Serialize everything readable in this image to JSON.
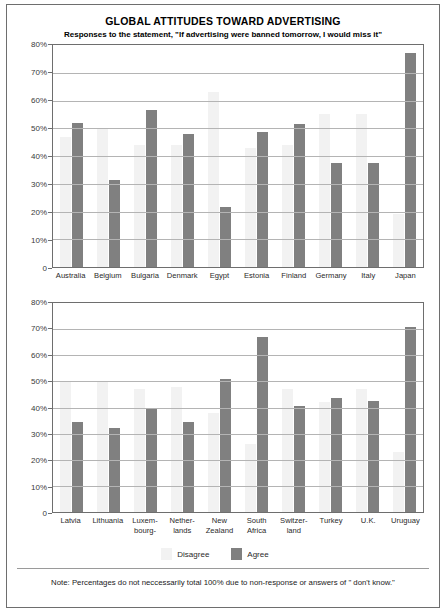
{
  "chart_data": [
    {
      "type": "bar",
      "title": "GLOBAL ATTITUDES TOWARD ADVERTISING",
      "subtitle": "Responses to the statement, \"If advertising were banned tomorrow, I would miss it\"",
      "panel": 1,
      "xlabel": "",
      "ylabel": "",
      "ylim": [
        0,
        80
      ],
      "yticks": [
        "0",
        "10%",
        "20%",
        "30%",
        "40%",
        "50%",
        "60%",
        "70%",
        "80%"
      ],
      "grid": true,
      "legend_position": "bottom",
      "categories": [
        "Australia",
        "Belgium",
        "Bulgaria",
        "Denmark",
        "Egypt",
        "Estonia",
        "Finland",
        "Germany",
        "Italy",
        "Japan"
      ],
      "series": [
        {
          "name": "Disagree",
          "color": "#f2f2f2",
          "values": [
            47,
            50,
            44,
            44,
            63,
            43,
            44,
            55,
            55,
            19
          ]
        },
        {
          "name": "Agree",
          "color": "#808080",
          "values": [
            52,
            31.5,
            56.5,
            48,
            21.5,
            48.5,
            51.5,
            37.5,
            37.5,
            77
          ]
        }
      ]
    },
    {
      "type": "bar",
      "panel": 2,
      "xlabel": "",
      "ylabel": "",
      "ylim": [
        0,
        80
      ],
      "yticks": [
        "0",
        "10%",
        "20%",
        "30%",
        "40%",
        "50%",
        "60%",
        "70%",
        "80%"
      ],
      "grid": true,
      "legend_position": "bottom",
      "categories": [
        "Latvia",
        "Lithuania",
        "Luxem-\nbourg-",
        "Nether-\nlands",
        "New\nZealand",
        "South\nAfrica",
        "Switzer-\nland",
        "Turkey",
        "U.K.",
        "Uruguay"
      ],
      "series": [
        {
          "name": "Disagree",
          "color": "#f2f2f2",
          "values": [
            50,
            50,
            47,
            48,
            38,
            26,
            47,
            42,
            47,
            23
          ]
        },
        {
          "name": "Agree",
          "color": "#808080",
          "values": [
            34.5,
            32,
            40,
            34.5,
            51,
            67,
            40.5,
            43.5,
            42.5,
            71
          ]
        }
      ]
    }
  ],
  "header": {
    "title": "GLOBAL ATTITUDES TOWARD ADVERTISING",
    "subtitle": "Responses to the statement, \"If advertising were banned tomorrow, I would miss it\""
  },
  "axis": {
    "ticks": [
      "80%",
      "70%",
      "60%",
      "50%",
      "40%",
      "30%",
      "20%",
      "10%",
      "0"
    ]
  },
  "panel1": {
    "categories": [
      "Australia",
      "Belgium",
      "Bulgaria",
      "Denmark",
      "Egypt",
      "Estonia",
      "Finland",
      "Germany",
      "Italy",
      "Japan"
    ]
  },
  "panel2": {
    "categories": [
      "Latvia",
      "Lithuania",
      "Luxem-\nbourg-",
      "Nether-\nlands",
      "New\nZealand",
      "South\nAfrica",
      "Switzer-\nland",
      "Turkey",
      "U.K.",
      "Uruguay"
    ]
  },
  "legend": {
    "items": [
      {
        "label": "Disagree",
        "color": "#f2f2f2"
      },
      {
        "label": "Agree",
        "color": "#808080"
      }
    ]
  },
  "footer": {
    "note": "Note: Percentages do not neccessarily total 100% due to non-response or answers of \" don't know.\""
  },
  "colors": {
    "agree": "#808080",
    "disagree": "#f2f2f2",
    "frame": "#6e6e6e",
    "gridline": "#b4b4b4"
  }
}
